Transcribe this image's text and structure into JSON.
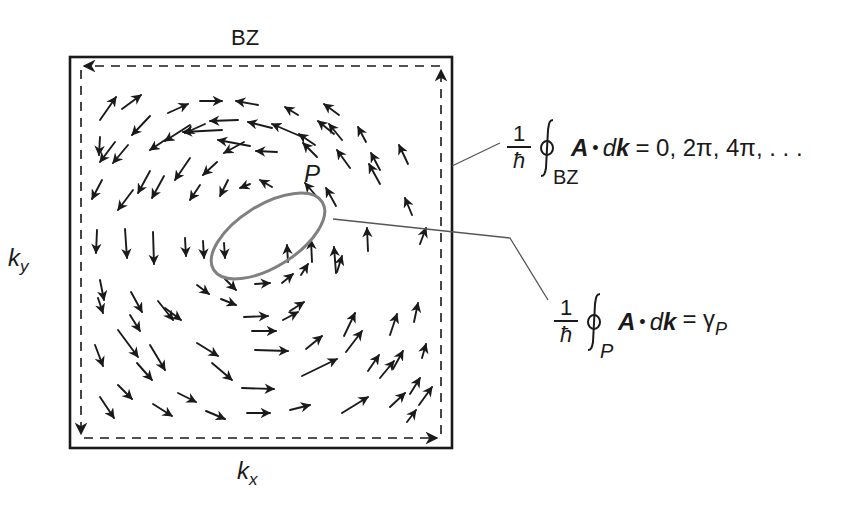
{
  "figure": {
    "type": "berry-connection-vector-field",
    "title_label": "BZ",
    "axis_labels": {
      "x": {
        "base": "k",
        "sub": "x"
      },
      "y": {
        "base": "k",
        "sub": "y"
      }
    },
    "loop_label": "P",
    "colors": {
      "ink": "#1a1a1a",
      "loop_stroke": "#808080",
      "leader_line": "#555555",
      "background": "#ffffff"
    },
    "boundary": {
      "outer_box": {
        "x": 70,
        "y": 57,
        "w": 382,
        "h": 391
      },
      "dashed_loop": {
        "x": 81,
        "y": 66,
        "w": 360,
        "h": 372,
        "direction": "counter-clockwise"
      }
    },
    "ellipse_P": {
      "cx": 268,
      "cy": 236,
      "rx": 64,
      "ry": 31,
      "rotation_deg": -32
    },
    "arrows": [
      [
        100,
        120,
        116,
        97
      ],
      [
        122,
        109,
        141,
        95
      ],
      [
        168,
        113,
        188,
        104
      ],
      [
        200,
        101,
        222,
        101
      ],
      [
        258,
        105,
        236,
        101
      ],
      [
        298,
        115,
        285,
        107
      ],
      [
        339,
        115,
        324,
        104
      ],
      [
        115,
        142,
        100,
        162
      ],
      [
        150,
        116,
        132,
        135
      ],
      [
        190,
        125,
        165,
        141
      ],
      [
        222,
        130,
        183,
        132
      ],
      [
        250,
        146,
        218,
        140
      ],
      [
        300,
        136,
        272,
        124
      ],
      [
        334,
        134,
        318,
        121
      ],
      [
        100,
        137,
        99,
        155
      ],
      [
        128,
        145,
        113,
        163
      ],
      [
        168,
        138,
        150,
        150
      ],
      [
        205,
        124,
        185,
        133
      ],
      [
        238,
        120,
        210,
        121
      ],
      [
        272,
        128,
        248,
        122
      ],
      [
        315,
        145,
        299,
        134
      ],
      [
        342,
        140,
        329,
        124
      ],
      [
        366,
        142,
        358,
        127
      ],
      [
        102,
        180,
        92,
        199
      ],
      [
        150,
        171,
        138,
        193
      ],
      [
        190,
        158,
        175,
        180
      ],
      [
        217,
        162,
        203,
        175
      ],
      [
        244,
        142,
        224,
        153
      ],
      [
        277,
        152,
        256,
        151
      ],
      [
        317,
        157,
        303,
        143
      ],
      [
        350,
        168,
        337,
        150
      ],
      [
        380,
        170,
        371,
        153
      ],
      [
        408,
        164,
        399,
        145
      ],
      [
        133,
        190,
        118,
        210
      ],
      [
        164,
        176,
        152,
        198
      ],
      [
        200,
        185,
        190,
        200
      ],
      [
        228,
        180,
        220,
        196
      ],
      [
        250,
        184,
        240,
        188
      ],
      [
        272,
        187,
        260,
        180
      ],
      [
        318,
        198,
        305,
        183
      ],
      [
        336,
        206,
        326,
        188
      ],
      [
        380,
        184,
        369,
        164
      ],
      [
        412,
        215,
        405,
        198
      ],
      [
        97,
        230,
        96,
        253
      ],
      [
        125,
        229,
        127,
        258
      ],
      [
        153,
        232,
        154,
        264
      ],
      [
        185,
        238,
        186,
        256
      ],
      [
        203,
        241,
        204,
        258
      ],
      [
        224,
        243,
        225,
        258
      ],
      [
        288,
        262,
        287,
        245
      ],
      [
        312,
        262,
        311,
        240
      ],
      [
        336,
        273,
        334,
        247
      ],
      [
        368,
        251,
        367,
        228
      ],
      [
        100,
        280,
        104,
        300
      ],
      [
        131,
        292,
        142,
        312
      ],
      [
        158,
        301,
        173,
        320
      ],
      [
        197,
        285,
        209,
        294
      ],
      [
        225,
        279,
        236,
        290
      ],
      [
        255,
        284,
        270,
        283
      ],
      [
        282,
        283,
        293,
        274
      ],
      [
        301,
        275,
        308,
        264
      ],
      [
        337,
        272,
        342,
        256
      ],
      [
        420,
        244,
        426,
        228
      ],
      [
        98,
        298,
        103,
        313
      ],
      [
        130,
        315,
        140,
        331
      ],
      [
        165,
        308,
        181,
        320
      ],
      [
        221,
        299,
        236,
        305
      ],
      [
        244,
        317,
        268,
        316
      ],
      [
        290,
        311,
        304,
        302
      ],
      [
        344,
        336,
        355,
        313
      ],
      [
        390,
        335,
        397,
        314
      ],
      [
        414,
        322,
        418,
        303
      ],
      [
        118,
        330,
        138,
        357
      ],
      [
        150,
        345,
        165,
        370
      ],
      [
        197,
        343,
        218,
        356
      ],
      [
        252,
        331,
        276,
        331
      ],
      [
        283,
        320,
        298,
        312
      ],
      [
        346,
        352,
        362,
        331
      ],
      [
        393,
        369,
        403,
        351
      ],
      [
        422,
        358,
        426,
        344
      ],
      [
        95,
        345,
        103,
        366
      ],
      [
        137,
        363,
        152,
        380
      ],
      [
        212,
        363,
        232,
        380
      ],
      [
        255,
        350,
        288,
        351
      ],
      [
        306,
        349,
        322,
        336
      ],
      [
        380,
        378,
        394,
        361
      ],
      [
        410,
        394,
        420,
        378
      ],
      [
        118,
        385,
        132,
        399
      ],
      [
        178,
        393,
        196,
        402
      ],
      [
        242,
        388,
        274,
        389
      ],
      [
        302,
        376,
        337,
        359
      ],
      [
        368,
        371,
        379,
        355
      ],
      [
        419,
        405,
        432,
        387
      ],
      [
        100,
        397,
        114,
        418
      ],
      [
        153,
        404,
        172,
        416
      ],
      [
        206,
        411,
        225,
        419
      ],
      [
        247,
        413,
        270,
        413
      ],
      [
        290,
        410,
        310,
        405
      ],
      [
        342,
        413,
        368,
        397
      ],
      [
        390,
        407,
        405,
        393
      ],
      [
        407,
        422,
        416,
        410
      ]
    ]
  },
  "equations": {
    "bz": {
      "prefactor_num": "1",
      "prefactor_den": "ħ",
      "integral_symbol": "∮",
      "subscript": "BZ",
      "integrand_A": "A",
      "integrand_dot": "•",
      "integrand_d": "d",
      "integrand_k": "k",
      "rhs": "= 0, 2π, 4π, . . ."
    },
    "p": {
      "prefactor_num": "1",
      "prefactor_den": "ħ",
      "integral_symbol": "∮",
      "subscript": "P",
      "integrand_A": "A",
      "integrand_dot": "•",
      "integrand_d": "d",
      "integrand_k": "k",
      "rhs": "= γ",
      "rhs_sub": "P"
    }
  },
  "leader_lines": [
    {
      "name": "bz-leader",
      "points": [
        [
          452,
          166
        ],
        [
          500,
          143
        ]
      ]
    },
    {
      "name": "p-leader",
      "points": [
        [
          333,
          219
        ],
        [
          510,
          238
        ],
        [
          548,
          300
        ]
      ]
    }
  ]
}
